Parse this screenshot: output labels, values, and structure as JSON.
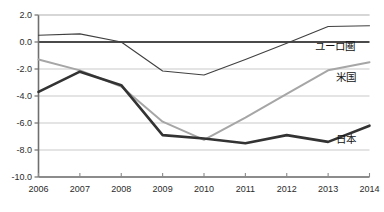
{
  "chart_data": {
    "type": "line",
    "title": "",
    "xlabel": "",
    "ylabel": "",
    "categories": [
      "2006",
      "2007",
      "2008",
      "2009",
      "2010",
      "2011",
      "2012",
      "2013",
      "2014"
    ],
    "x": [
      2006,
      2007,
      2008,
      2009,
      2010,
      2011,
      2012,
      2013,
      2014
    ],
    "ylim": [
      -10.0,
      2.0
    ],
    "yticks": [
      2.0,
      0.0,
      -2.0,
      -4.0,
      -6.0,
      -8.0,
      -10.0
    ],
    "ytick_labels": [
      "2.0",
      "0.0",
      "-2.0",
      "-4.0",
      "-6.0",
      "-8.0",
      "-10.0"
    ],
    "grid": true,
    "grid_axis": "y",
    "legend_position": "inline-right",
    "zero_line": 0.0,
    "series": [
      {
        "name": "ユーロ圏",
        "color": "#404040",
        "width": 1.1,
        "values": [
          0.5,
          0.6,
          0.0,
          -2.15,
          -2.45,
          -1.3,
          -0.1,
          1.15,
          1.2
        ],
        "label_value": -0.3
      },
      {
        "name": "米国",
        "color": "#a6a6a6",
        "width": 2.0,
        "values": [
          -1.3,
          -2.1,
          -3.3,
          -5.9,
          -7.25,
          -5.6,
          -3.85,
          -2.1,
          -1.5
        ],
        "label_value": -2.6
      },
      {
        "name": "日本",
        "color": "#333333",
        "width": 2.6,
        "values": [
          -3.7,
          -2.2,
          -3.2,
          -6.9,
          -7.15,
          -7.5,
          -6.9,
          -7.4,
          -6.2
        ],
        "label_value": -7.2
      }
    ]
  },
  "axis": {
    "ytick_labels": [
      "2.0",
      "0.0",
      "-2.0",
      "-4.0",
      "-6.0",
      "-8.0",
      "-10.0"
    ],
    "xtick_labels": [
      "2006",
      "2007",
      "2008",
      "2009",
      "2010",
      "2011",
      "2012",
      "2013",
      "2014"
    ]
  },
  "legend": {
    "items": [
      {
        "label": "ユーロ圏"
      },
      {
        "label": "米国"
      },
      {
        "label": "日本"
      }
    ]
  }
}
